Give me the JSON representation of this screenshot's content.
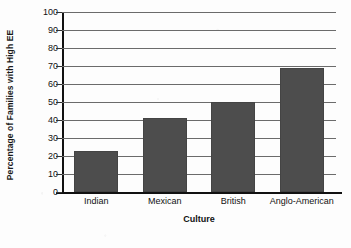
{
  "chart_data": {
    "type": "bar",
    "title": "",
    "categories": [
      "Indian",
      "Mexican",
      "British",
      "Anglo-American"
    ],
    "values": [
      23,
      41,
      50,
      69
    ],
    "xlabel": "Culture",
    "ylabel": "Percentage of Families with High EE",
    "ylim": [
      0,
      100
    ],
    "ytick_step": 10,
    "yticks": [
      "0",
      "10",
      "20",
      "30",
      "40",
      "50",
      "60",
      "70",
      "80",
      "90",
      "100"
    ],
    "grid": "horizontal",
    "legend": "none",
    "bar_color": "#4d4d4d",
    "gridline_color": "#6b6b6b",
    "axis_color": "#111111",
    "background_color": "#fdfdfd"
  }
}
